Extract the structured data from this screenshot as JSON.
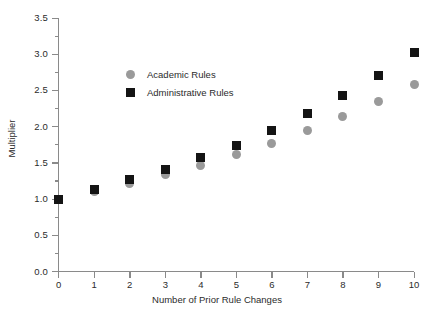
{
  "chart_data": {
    "type": "scatter",
    "title": "",
    "xlabel": "Number of Prior Rule Changes",
    "ylabel": "Multiplier",
    "xlim": [
      0,
      10
    ],
    "ylim": [
      0.0,
      3.5
    ],
    "x": [
      0,
      1,
      2,
      3,
      4,
      5,
      6,
      7,
      8,
      9,
      10
    ],
    "xticks": [
      "0",
      "1",
      "2",
      "3",
      "4",
      "5",
      "6",
      "7",
      "8",
      "9",
      "10"
    ],
    "yticks": [
      "0.0",
      "0.5",
      "1.0",
      "1.5",
      "2.0",
      "2.5",
      "3.0",
      "3.5"
    ],
    "ytick_values": [
      0.0,
      0.5,
      1.0,
      1.5,
      2.0,
      2.5,
      3.0,
      3.5
    ],
    "yminor_values": [
      0.25,
      0.75,
      1.25,
      1.75,
      2.25,
      2.75,
      3.25
    ],
    "grid": false,
    "legend_position": "upper-left-inside",
    "series": [
      {
        "name": "Academic Rules",
        "marker": "circle",
        "color": "#9a9a9a",
        "values": [
          1.0,
          1.1,
          1.22,
          1.34,
          1.47,
          1.61,
          1.77,
          1.95,
          2.14,
          2.35,
          2.58
        ]
      },
      {
        "name": "Administrative Rules",
        "marker": "square",
        "color": "#141414",
        "values": [
          1.0,
          1.13,
          1.27,
          1.41,
          1.57,
          1.74,
          1.95,
          2.18,
          2.43,
          2.71,
          3.03
        ]
      }
    ]
  },
  "legend": {
    "items": [
      {
        "label": "Academic Rules",
        "marker": "circle"
      },
      {
        "label": "Administrative Rules",
        "marker": "square"
      }
    ]
  }
}
